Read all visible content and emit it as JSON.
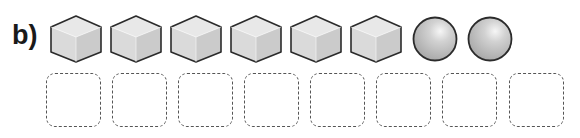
{
  "exercise": {
    "label": "b)",
    "shapes": [
      {
        "type": "cube",
        "icon": "cube-icon"
      },
      {
        "type": "cube",
        "icon": "cube-icon"
      },
      {
        "type": "cube",
        "icon": "cube-icon"
      },
      {
        "type": "cube",
        "icon": "cube-icon"
      },
      {
        "type": "cube",
        "icon": "cube-icon"
      },
      {
        "type": "cube",
        "icon": "cube-icon"
      },
      {
        "type": "sphere",
        "icon": "sphere-icon"
      },
      {
        "type": "sphere",
        "icon": "sphere-icon"
      }
    ],
    "answer_boxes": [
      {
        "value": ""
      },
      {
        "value": ""
      },
      {
        "value": ""
      },
      {
        "value": ""
      },
      {
        "value": ""
      },
      {
        "value": ""
      },
      {
        "value": ""
      },
      {
        "value": ""
      }
    ]
  },
  "colors": {
    "outline": "#2b2b2b",
    "cube_top": "#e6e6e6",
    "cube_left": "#d9d9d9",
    "cube_right": "#c9c9c9",
    "sphere_base": "#b8b8b8",
    "sphere_highlight": "#f4f4f4",
    "box_border": "#555555"
  }
}
